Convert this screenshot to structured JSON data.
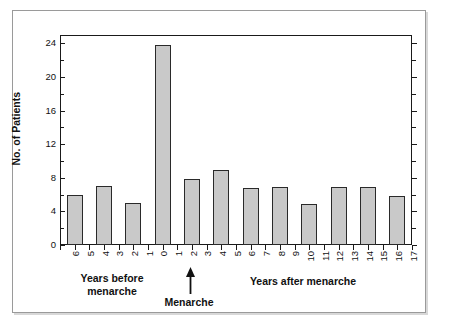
{
  "chart_data": {
    "type": "bar",
    "title": "",
    "xlabel": "",
    "ylabel": "No. of Patients",
    "ylim": [
      0,
      25
    ],
    "yticks": [
      0,
      4,
      8,
      12,
      16,
      20,
      24
    ],
    "ytick_labels": [
      "0",
      "4",
      "8",
      "12",
      "16",
      "20",
      "24"
    ],
    "yminor_ticks": [
      2,
      6,
      10,
      14,
      18,
      22
    ],
    "grid": false,
    "legend": null,
    "xtick_labels": [
      "6",
      "5",
      "4",
      "3",
      "2",
      "1",
      "0",
      "1",
      "2",
      "3",
      "4",
      "5",
      "6",
      "7",
      "8",
      "9",
      "10",
      "11",
      "12",
      "13",
      "14",
      "15",
      "16",
      "17"
    ],
    "bin_labels": [
      "6-5",
      "4-3",
      "2-1",
      "0-1",
      "2-3",
      "4-5",
      "6-7",
      "8-9",
      "10-11",
      "12-13",
      "14-15",
      "16-17"
    ],
    "categories": [
      "6-5",
      "4-3",
      "2-1",
      "0-1",
      "2-3",
      "4-5",
      "6-7",
      "8-9",
      "10-11",
      "12-13",
      "14-15",
      "16-17"
    ],
    "values": [
      6,
      7,
      5,
      23.8,
      7.9,
      8.9,
      6.8,
      6.9,
      4.9,
      6.9,
      6.9,
      5.8
    ],
    "bar_color": "#c9c9c9",
    "bar_edge_color": "#2a2a2a",
    "axis_color": "#1a1a1a"
  },
  "annotations": {
    "years_before_line1": "Years before",
    "years_before_line2": "menarche",
    "menarche": "Menarche",
    "years_after": "Years after menarche"
  }
}
